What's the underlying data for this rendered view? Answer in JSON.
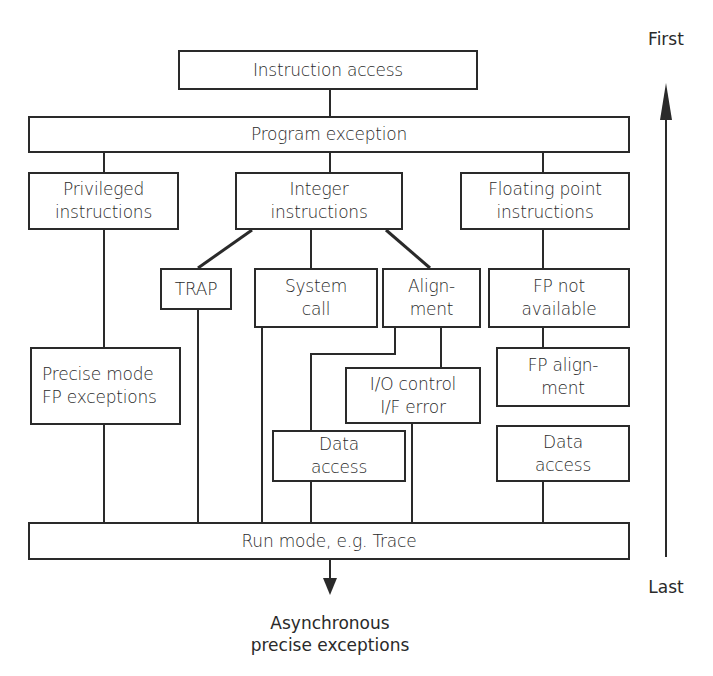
{
  "diagram": {
    "type": "exception-priority-hierarchy",
    "axis": {
      "top_label": "First",
      "bottom_label": "Last"
    },
    "output_label": "Asynchronous\nprecise exceptions",
    "nodes": {
      "instruction_access": "Instruction access",
      "program_exception": "Program exception",
      "privileged": "Privileged\ninstructions",
      "integer": "Integer\ninstructions",
      "floating_point": "Floating point\ninstructions",
      "trap": "TRAP",
      "system_call": "System\ncall",
      "alignment": "Align-\nment",
      "fp_not_available": "FP not\navailable",
      "precise_mode": "Precise mode\nFP exceptions",
      "io_control": "I/O  control\nI/F error",
      "fp_alignment": "FP align-\nment",
      "data_access_int": "Data\naccess",
      "data_access_fp": "Data\naccess",
      "run_mode": "Run mode, e.g. Trace"
    },
    "edges": [
      [
        "instruction_access",
        "program_exception"
      ],
      [
        "program_exception",
        "privileged"
      ],
      [
        "program_exception",
        "integer"
      ],
      [
        "program_exception",
        "floating_point"
      ],
      [
        "privileged",
        "precise_mode"
      ],
      [
        "precise_mode",
        "run_mode"
      ],
      [
        "integer",
        "trap"
      ],
      [
        "integer",
        "system_call"
      ],
      [
        "integer",
        "alignment"
      ],
      [
        "trap",
        "run_mode"
      ],
      [
        "system_call",
        "run_mode"
      ],
      [
        "alignment",
        "data_access_int"
      ],
      [
        "alignment",
        "io_control"
      ],
      [
        "data_access_int",
        "run_mode"
      ],
      [
        "io_control",
        "run_mode"
      ],
      [
        "floating_point",
        "fp_not_available"
      ],
      [
        "fp_not_available",
        "fp_alignment"
      ],
      [
        "fp_alignment",
        "data_access_fp"
      ],
      [
        "data_access_fp",
        "run_mode"
      ],
      [
        "run_mode",
        "asynchronous_output"
      ]
    ]
  }
}
